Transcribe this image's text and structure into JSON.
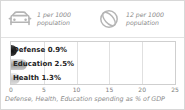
{
  "stats": [
    {
      "icon": "car-icon",
      "line1": "1 per 1000",
      "line2": "population"
    },
    {
      "icon": "ball-icon",
      "line1": "12 per 1000",
      "line2": "population"
    }
  ],
  "chart_data": {
    "type": "bar",
    "orientation": "horizontal",
    "title": "",
    "caption": "Defense, Health, Education spending as % of GDP",
    "xlabel": "",
    "ylabel": "",
    "categories": [
      "Defense",
      "Education",
      "Health"
    ],
    "values": [
      0.9,
      2.5,
      1.3
    ],
    "data_labels": [
      "Defense 0.9%",
      "Education 2.5%",
      "Health 1.3%"
    ],
    "colors": [
      "#111111",
      "#9a9a9a",
      "#c2c2c2"
    ],
    "xlim": [
      0,
      25
    ],
    "xticks": [
      0,
      5,
      10,
      15,
      20,
      25
    ],
    "xtick_labels": [
      "0",
      "5",
      "10",
      "15",
      "20",
      "25"
    ],
    "grid": true,
    "legend": false
  }
}
